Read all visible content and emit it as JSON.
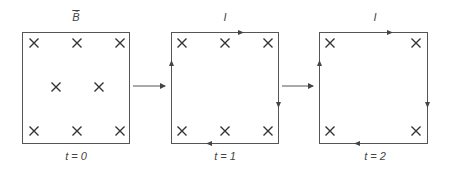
{
  "diagram": {
    "colors": {
      "line": "#555555",
      "cross": "#333333"
    },
    "field_label": "B̄",
    "current_label": "I",
    "panels": [
      {
        "time_label": "t = 0",
        "has_current": false,
        "crosses": [
          [
            34,
            43
          ],
          [
            77,
            43
          ],
          [
            120,
            43
          ],
          [
            56,
            87
          ],
          [
            99,
            87
          ],
          [
            34,
            131
          ],
          [
            77,
            131
          ],
          [
            120,
            131
          ]
        ]
      },
      {
        "time_label": "t = 1",
        "has_current": true,
        "crosses": [
          [
            182,
            43
          ],
          [
            225,
            43
          ],
          [
            268,
            43
          ],
          [
            182,
            131
          ],
          [
            225,
            131
          ],
          [
            268,
            131
          ]
        ]
      },
      {
        "time_label": "t = 2",
        "has_current": true,
        "crosses": [
          [
            330,
            43
          ],
          [
            416,
            43
          ],
          [
            330,
            131
          ],
          [
            416,
            131
          ]
        ]
      }
    ],
    "transitions": [
      "t=0 → t=1",
      "t=1 → t=2"
    ]
  }
}
